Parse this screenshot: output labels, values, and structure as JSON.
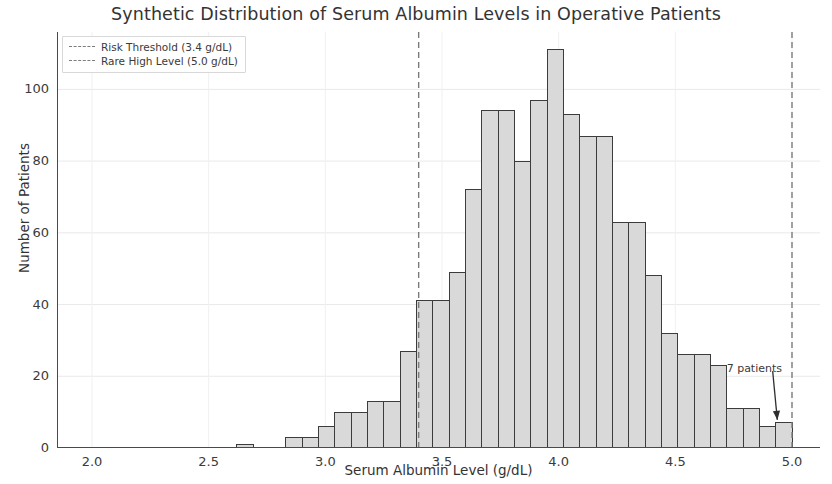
{
  "chart_data": {
    "type": "bar",
    "title": "Synthetic Distribution of Serum Albumin Levels in Operative Patients",
    "xlabel": "Serum Albumin Level (g/dL)",
    "ylabel": "Number of Patients",
    "xlim": [
      1.85,
      5.12
    ],
    "ylim": [
      0,
      116
    ],
    "grid": true,
    "bin_width": 0.07,
    "x_ticks": [
      "2.0",
      "2.5",
      "3.0",
      "3.5",
      "4.0",
      "4.5",
      "5.0"
    ],
    "x_tick_values": [
      2.0,
      2.5,
      3.0,
      3.5,
      4.0,
      4.5,
      5.0
    ],
    "y_ticks": [
      "0",
      "20",
      "40",
      "60",
      "80",
      "100"
    ],
    "y_tick_values": [
      0,
      20,
      40,
      60,
      80,
      100
    ],
    "bar_face_color": "#d9d9d9",
    "bar_edge_color": "#3c3c3c",
    "bin_centers": [
      2.655,
      2.865,
      2.935,
      3.005,
      3.075,
      3.145,
      3.215,
      3.285,
      3.355,
      3.425,
      3.495,
      3.565,
      3.635,
      3.705,
      3.775,
      3.845,
      3.915,
      3.985,
      4.055,
      4.125,
      4.195,
      4.265,
      4.335,
      4.405,
      4.475,
      4.545,
      4.615,
      4.685,
      4.755,
      4.825,
      4.895,
      4.965
    ],
    "values": [
      1,
      3,
      3,
      6,
      10,
      10,
      13,
      13,
      27,
      41,
      41,
      49,
      72,
      94,
      94,
      80,
      97,
      111,
      93,
      87,
      87,
      63,
      63,
      48,
      32,
      26,
      26,
      23,
      11,
      11,
      6,
      7
    ],
    "series": [
      {
        "name": "Serum albumin histogram",
        "values": [
          1,
          3,
          3,
          6,
          10,
          10,
          13,
          13,
          27,
          41,
          41,
          49,
          72,
          94,
          94,
          80,
          97,
          111,
          93,
          87,
          87,
          63,
          63,
          48,
          32,
          26,
          26,
          23,
          11,
          11,
          6,
          7
        ]
      }
    ],
    "vlines": [
      {
        "label": "Risk Threshold (3.4 g/dL)",
        "value": 3.4,
        "color": "#7c7c7c",
        "style": "dashed"
      },
      {
        "label": "Rare High Level (5.0 g/dL)",
        "value": 5.0,
        "color": "#7c7c7c",
        "style": "dashed"
      }
    ],
    "annotations": [
      {
        "text": "7 patients",
        "x": 4.95,
        "y": 7,
        "text_x": 4.72,
        "text_y": 22,
        "arrow": true
      }
    ],
    "legend": {
      "position": "upper-left",
      "entries": [
        "Risk Threshold (3.4 g/dL)",
        "Rare High Level (5.0 g/dL)"
      ]
    }
  }
}
